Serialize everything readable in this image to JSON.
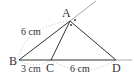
{
  "diagram": {
    "points": {
      "A": {
        "label": "A",
        "x": 70,
        "y": 21
      },
      "B": {
        "label": "B",
        "x": 19,
        "y": 60
      },
      "C": {
        "label": "C",
        "x": 51,
        "y": 60
      },
      "D": {
        "label": "D",
        "x": 116,
        "y": 60
      }
    },
    "measurements": {
      "AB": "6 cm",
      "BC": "3 cm",
      "CD": "6 cm"
    },
    "colors": {
      "line": "#333333",
      "extension": "#aaaaaa",
      "dotted": "#bbbbbb"
    }
  }
}
